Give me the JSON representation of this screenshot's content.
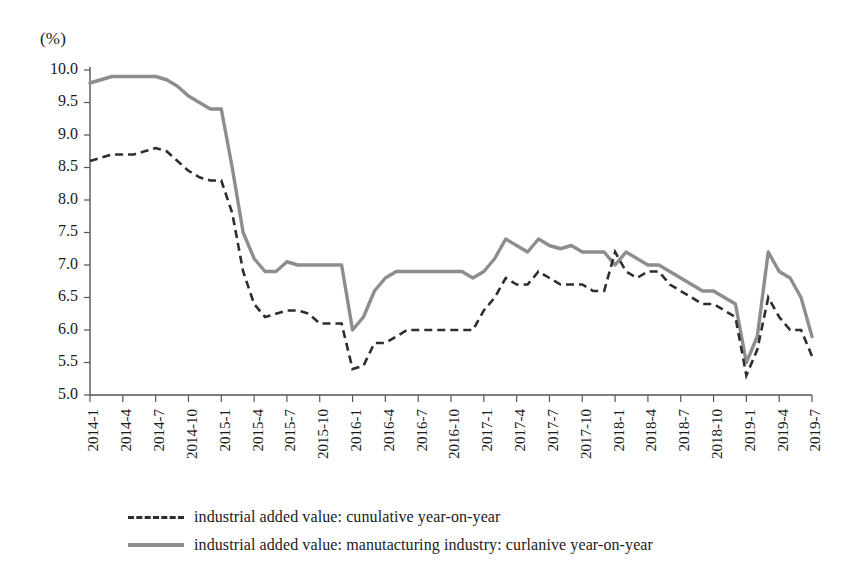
{
  "chart_data": {
    "type": "line",
    "title": "",
    "subtitle": "",
    "xlabel": "",
    "ylabel": "",
    "unit_label": "(%)",
    "ylim": [
      5.0,
      10.0
    ],
    "ytick_values": [
      5.0,
      5.5,
      6.0,
      6.5,
      7.0,
      7.5,
      8.0,
      8.5,
      9.0,
      9.5,
      10.0
    ],
    "ytick_labels": [
      "5.0",
      "5.5",
      "6.0",
      "6.5",
      "7.0",
      "7.5",
      "8.0",
      "8.5",
      "9.0",
      "9.5",
      "10.0"
    ],
    "grid": false,
    "legend_position": "bottom",
    "x": [
      "2014-1",
      "2014-2",
      "2014-3",
      "2014-4",
      "2014-5",
      "2014-6",
      "2014-7",
      "2014-8",
      "2014-9",
      "2014-10",
      "2014-11",
      "2014-12",
      "2015-1",
      "2015-2",
      "2015-3",
      "2015-4",
      "2015-5",
      "2015-6",
      "2015-7",
      "2015-8",
      "2015-9",
      "2015-10",
      "2015-11",
      "2015-12",
      "2016-1",
      "2016-2",
      "2016-3",
      "2016-4",
      "2016-5",
      "2016-6",
      "2016-7",
      "2016-8",
      "2016-9",
      "2016-10",
      "2016-11",
      "2016-12",
      "2017-1",
      "2017-2",
      "2017-3",
      "2017-4",
      "2017-5",
      "2017-6",
      "2017-7",
      "2017-8",
      "2017-9",
      "2017-10",
      "2017-11",
      "2017-12",
      "2018-1",
      "2018-2",
      "2018-3",
      "2018-4",
      "2018-5",
      "2018-6",
      "2018-7",
      "2018-8",
      "2018-9",
      "2018-10",
      "2018-11",
      "2018-12",
      "2019-1",
      "2019-2",
      "2019-3",
      "2019-4",
      "2019-5",
      "2019-6",
      "2019-7"
    ],
    "xtick_labels": [
      "2014-1",
      "2014-4",
      "2014-7",
      "2014-10",
      "2015-1",
      "2015-4",
      "2015-7",
      "2015-10",
      "2016-1",
      "2016-4",
      "2016-7",
      "2016-10",
      "2017-1",
      "2017-4",
      "2017-7",
      "2017-10",
      "2018-1",
      "2018-4",
      "2018-7",
      "2018-10",
      "2019-1",
      "2019-4",
      "2019-7"
    ],
    "xtick_indices": [
      0,
      3,
      6,
      9,
      12,
      15,
      18,
      21,
      24,
      27,
      30,
      33,
      36,
      39,
      42,
      45,
      48,
      51,
      54,
      57,
      60,
      63,
      66
    ],
    "series": [
      {
        "name": "industrial added value: cunulative year-on-year",
        "style": "dashed",
        "color": "#2e2e2e",
        "values": [
          8.6,
          8.65,
          8.7,
          8.7,
          8.7,
          8.75,
          8.8,
          8.75,
          8.6,
          8.45,
          8.35,
          8.3,
          8.3,
          7.8,
          6.9,
          6.4,
          6.2,
          6.25,
          6.3,
          6.3,
          6.25,
          6.1,
          6.1,
          6.1,
          5.4,
          5.45,
          5.8,
          5.8,
          5.9,
          6.0,
          6.0,
          6.0,
          6.0,
          6.0,
          6.0,
          6.0,
          6.3,
          6.5,
          6.8,
          6.7,
          6.7,
          6.9,
          6.8,
          6.7,
          6.7,
          6.7,
          6.6,
          6.6,
          7.2,
          6.9,
          6.8,
          6.9,
          6.9,
          6.7,
          6.6,
          6.5,
          6.4,
          6.4,
          6.3,
          6.2,
          5.3,
          5.7,
          6.5,
          6.2,
          6.0,
          6.0,
          5.6
        ]
      },
      {
        "name": "industrial added value: manutacturing industry: curlanive year-on-year",
        "style": "solid",
        "color": "#8d8d8d",
        "values": [
          9.8,
          9.85,
          9.9,
          9.9,
          9.9,
          9.9,
          9.9,
          9.85,
          9.75,
          9.6,
          9.5,
          9.4,
          9.4,
          8.5,
          7.5,
          7.1,
          6.9,
          6.9,
          7.05,
          7.0,
          7.0,
          7.0,
          7.0,
          7.0,
          6.0,
          6.2,
          6.6,
          6.8,
          6.9,
          6.9,
          6.9,
          6.9,
          6.9,
          6.9,
          6.9,
          6.8,
          6.9,
          7.1,
          7.4,
          7.3,
          7.2,
          7.4,
          7.3,
          7.25,
          7.3,
          7.2,
          7.2,
          7.2,
          7.0,
          7.2,
          7.1,
          7.0,
          7.0,
          6.9,
          6.8,
          6.7,
          6.6,
          6.6,
          6.5,
          6.4,
          5.5,
          5.9,
          7.2,
          6.9,
          6.8,
          6.5,
          5.9
        ]
      }
    ]
  },
  "legend": {
    "entries": [
      {
        "label": "industrial added value: cunulative year-on-year",
        "style": "dashed"
      },
      {
        "label": "industrial added value: manutacturing industry: curlanive year-on-year",
        "style": "solid"
      }
    ]
  },
  "axes": {
    "unit": "(%)",
    "y_min_label": "5.0",
    "y_max_label": "10.0"
  }
}
